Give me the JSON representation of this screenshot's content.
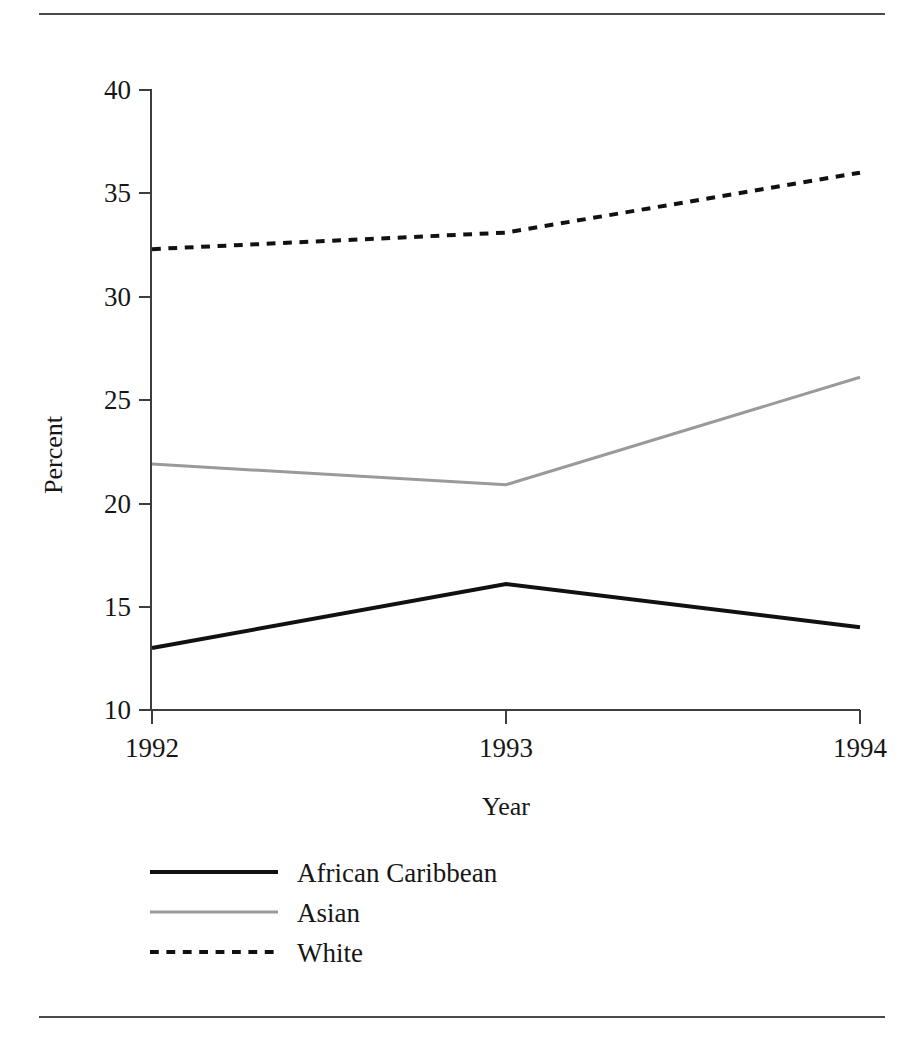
{
  "figure": {
    "top_rule": "horizontal-rule",
    "bottom_rule": "horizontal-rule"
  },
  "chart_data": {
    "type": "line",
    "title": "",
    "xlabel": "Year",
    "ylabel": "Percent",
    "categories": [
      "1992",
      "1993",
      "1994"
    ],
    "x": [
      1992,
      1993,
      1994
    ],
    "xlim": [
      1992,
      1994
    ],
    "ylim": [
      10,
      40
    ],
    "yticks": [
      10,
      15,
      20,
      25,
      30,
      35,
      40
    ],
    "ytick_labels": [
      "10",
      "15",
      "20",
      "25",
      "30",
      "35",
      "40"
    ],
    "xtick_labels": [
      "1992",
      "1993",
      "1994"
    ],
    "grid": false,
    "legend_position": "below-axes-left",
    "series": [
      {
        "name": "African Caribbean",
        "values": [
          13.0,
          16.1,
          14.0
        ],
        "color": "#111111",
        "style": "solid",
        "width": 4
      },
      {
        "name": "Asian",
        "values": [
          21.9,
          20.9,
          26.1
        ],
        "color": "#9a9a9a",
        "style": "solid",
        "width": 3
      },
      {
        "name": "White",
        "values": [
          32.3,
          33.1,
          36.0
        ],
        "color": "#111111",
        "style": "dashed",
        "width": 4
      }
    ]
  },
  "axes": {
    "y_title": "Percent",
    "x_title": "Year",
    "y_tick_0": "10",
    "y_tick_1": "15",
    "y_tick_2": "20",
    "y_tick_3": "25",
    "y_tick_4": "30",
    "y_tick_5": "35",
    "y_tick_6": "40",
    "x_tick_0": "1992",
    "x_tick_1": "1993",
    "x_tick_2": "1994"
  },
  "legend": {
    "items": [
      {
        "label": "African Caribbean"
      },
      {
        "label": "Asian"
      },
      {
        "label": "White"
      }
    ]
  }
}
